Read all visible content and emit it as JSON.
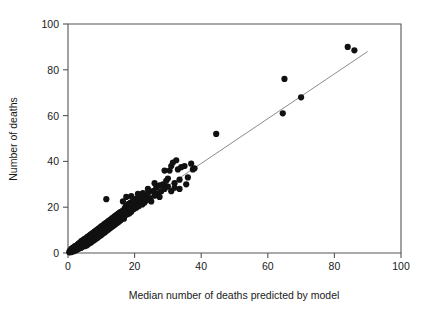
{
  "chart_data": {
    "type": "scatter",
    "title": "",
    "xlabel": "Median number of deaths predicted by model",
    "ylabel": "Number of deaths",
    "xlim": [
      0,
      100
    ],
    "ylim": [
      0,
      100
    ],
    "xticks": [
      0,
      20,
      40,
      60,
      80,
      100
    ],
    "yticks": [
      0,
      20,
      40,
      60,
      80,
      100
    ],
    "xticklabels": [
      "0",
      "20",
      "40",
      "60",
      "80",
      "100"
    ],
    "yticklabels": [
      "0",
      "20",
      "40",
      "60",
      "80",
      "100"
    ],
    "grid": false,
    "legend": null,
    "marker_color": "#111111",
    "marker_size": 4.0,
    "reference_line": {
      "name": "identity-fit-line",
      "color": "#8c8c8c",
      "x0": 0,
      "y0": 0,
      "x1": 90,
      "y1": 88
    },
    "points": [
      [
        0.4,
        0.3
      ],
      [
        0.5,
        0.8
      ],
      [
        0.6,
        0.4
      ],
      [
        0.7,
        1.1
      ],
      [
        0.8,
        0.5
      ],
      [
        0.9,
        1.4
      ],
      [
        1.0,
        0.7
      ],
      [
        1.0,
        1.8
      ],
      [
        1.1,
        0.4
      ],
      [
        1.2,
        1.2
      ],
      [
        1.3,
        2.0
      ],
      [
        1.4,
        0.9
      ],
      [
        1.5,
        1.6
      ],
      [
        1.5,
        2.4
      ],
      [
        1.6,
        1.1
      ],
      [
        1.7,
        2.1
      ],
      [
        1.8,
        0.8
      ],
      [
        1.9,
        1.7
      ],
      [
        2.0,
        2.6
      ],
      [
        2.0,
        1.3
      ],
      [
        2.1,
        3.0
      ],
      [
        2.2,
        1.9
      ],
      [
        2.3,
        2.5
      ],
      [
        2.4,
        1.2
      ],
      [
        2.5,
        3.2
      ],
      [
        2.6,
        2.1
      ],
      [
        2.7,
        1.5
      ],
      [
        2.8,
        3.5
      ],
      [
        2.9,
        2.4
      ],
      [
        3.0,
        1.8
      ],
      [
        3.0,
        3.8
      ],
      [
        3.1,
        2.7
      ],
      [
        3.2,
        4.1
      ],
      [
        3.3,
        2.0
      ],
      [
        3.4,
        3.3
      ],
      [
        3.5,
        4.4
      ],
      [
        3.6,
        2.6
      ],
      [
        3.7,
        3.9
      ],
      [
        3.8,
        2.2
      ],
      [
        3.9,
        4.8
      ],
      [
        4.0,
        3.1
      ],
      [
        4.0,
        5.2
      ],
      [
        4.1,
        2.5
      ],
      [
        4.2,
        4.3
      ],
      [
        4.3,
        3.6
      ],
      [
        4.4,
        5.5
      ],
      [
        4.5,
        2.9
      ],
      [
        4.6,
        4.6
      ],
      [
        4.7,
        3.4
      ],
      [
        4.8,
        5.9
      ],
      [
        4.9,
        4.0
      ],
      [
        5.0,
        3.0
      ],
      [
        5.0,
        6.2
      ],
      [
        5.1,
        4.8
      ],
      [
        5.2,
        3.7
      ],
      [
        5.3,
        5.6
      ],
      [
        5.4,
        4.2
      ],
      [
        5.5,
        6.5
      ],
      [
        5.6,
        3.3
      ],
      [
        5.7,
        5.1
      ],
      [
        5.8,
        6.9
      ],
      [
        5.9,
        4.5
      ],
      [
        6.0,
        3.8
      ],
      [
        6.0,
        7.2
      ],
      [
        6.1,
        5.4
      ],
      [
        6.2,
        4.1
      ],
      [
        6.3,
        6.3
      ],
      [
        6.4,
        7.6
      ],
      [
        6.5,
        5.0
      ],
      [
        6.6,
        4.4
      ],
      [
        6.7,
        6.8
      ],
      [
        6.8,
        8.0
      ],
      [
        6.9,
        5.7
      ],
      [
        7.0,
        4.7
      ],
      [
        7.0,
        7.3
      ],
      [
        7.1,
        8.4
      ],
      [
        7.2,
        6.1
      ],
      [
        7.3,
        5.2
      ],
      [
        7.4,
        7.8
      ],
      [
        7.5,
        8.8
      ],
      [
        7.6,
        6.5
      ],
      [
        7.7,
        5.5
      ],
      [
        7.8,
        8.2
      ],
      [
        7.9,
        9.2
      ],
      [
        8.0,
        6.9
      ],
      [
        8.0,
        5.8
      ],
      [
        8.1,
        8.6
      ],
      [
        8.2,
        9.6
      ],
      [
        8.3,
        7.3
      ],
      [
        8.4,
        6.2
      ],
      [
        8.5,
        9.0
      ],
      [
        8.6,
        10.0
      ],
      [
        8.7,
        7.7
      ],
      [
        8.8,
        6.6
      ],
      [
        8.9,
        9.4
      ],
      [
        9.0,
        10.4
      ],
      [
        9.0,
        8.1
      ],
      [
        9.1,
        7.0
      ],
      [
        9.2,
        9.8
      ],
      [
        9.3,
        10.8
      ],
      [
        9.4,
        8.5
      ],
      [
        9.5,
        7.4
      ],
      [
        9.6,
        10.2
      ],
      [
        9.7,
        11.2
      ],
      [
        9.8,
        8.9
      ],
      [
        9.9,
        7.8
      ],
      [
        10.0,
        10.6
      ],
      [
        10.0,
        11.6
      ],
      [
        10.1,
        9.3
      ],
      [
        10.2,
        8.2
      ],
      [
        10.3,
        11.0
      ],
      [
        10.4,
        12.0
      ],
      [
        10.5,
        9.7
      ],
      [
        10.6,
        8.6
      ],
      [
        10.7,
        11.4
      ],
      [
        10.8,
        12.4
      ],
      [
        10.9,
        10.1
      ],
      [
        11.0,
        9.0
      ],
      [
        11.0,
        11.8
      ],
      [
        11.1,
        12.8
      ],
      [
        11.2,
        10.5
      ],
      [
        11.3,
        9.4
      ],
      [
        11.4,
        12.2
      ],
      [
        11.5,
        13.2
      ],
      [
        11.6,
        10.9
      ],
      [
        11.7,
        9.8
      ],
      [
        11.8,
        12.6
      ],
      [
        11.9,
        13.6
      ],
      [
        12.0,
        11.3
      ],
      [
        12.0,
        10.2
      ],
      [
        12.1,
        13.0
      ],
      [
        12.2,
        14.0
      ],
      [
        12.3,
        11.7
      ],
      [
        12.4,
        10.6
      ],
      [
        12.5,
        13.4
      ],
      [
        12.6,
        14.4
      ],
      [
        12.7,
        12.1
      ],
      [
        12.8,
        11.0
      ],
      [
        12.9,
        13.8
      ],
      [
        13.0,
        14.8
      ],
      [
        13.0,
        12.5
      ],
      [
        13.1,
        11.4
      ],
      [
        13.2,
        14.2
      ],
      [
        13.3,
        15.2
      ],
      [
        13.4,
        12.9
      ],
      [
        13.5,
        11.8
      ],
      [
        13.6,
        14.6
      ],
      [
        13.7,
        15.6
      ],
      [
        13.8,
        13.3
      ],
      [
        13.9,
        12.2
      ],
      [
        14.0,
        15.0
      ],
      [
        14.0,
        16.0
      ],
      [
        14.1,
        13.7
      ],
      [
        14.2,
        12.6
      ],
      [
        14.3,
        15.4
      ],
      [
        14.4,
        16.4
      ],
      [
        14.5,
        14.1
      ],
      [
        14.6,
        13.0
      ],
      [
        14.7,
        15.8
      ],
      [
        14.8,
        16.8
      ],
      [
        14.9,
        14.5
      ],
      [
        15.0,
        13.4
      ],
      [
        15.0,
        16.2
      ],
      [
        15.1,
        17.2
      ],
      [
        15.2,
        14.9
      ],
      [
        15.3,
        13.8
      ],
      [
        15.4,
        16.6
      ],
      [
        15.5,
        17.6
      ],
      [
        15.6,
        15.3
      ],
      [
        15.7,
        14.2
      ],
      [
        15.8,
        17.0
      ],
      [
        15.9,
        18.0
      ],
      [
        16.0,
        15.7
      ],
      [
        16.0,
        14.6
      ],
      [
        16.2,
        17.4
      ],
      [
        16.4,
        18.4
      ],
      [
        16.6,
        16.1
      ],
      [
        16.8,
        15.0
      ],
      [
        17.0,
        17.8
      ],
      [
        17.0,
        19.5
      ],
      [
        17.2,
        16.5
      ],
      [
        17.4,
        20.5
      ],
      [
        17.6,
        18.2
      ],
      [
        17.8,
        16.9
      ],
      [
        18.0,
        19.0
      ],
      [
        18.2,
        21.5
      ],
      [
        18.4,
        17.3
      ],
      [
        18.6,
        19.8
      ],
      [
        18.8,
        22.0
      ],
      [
        19.0,
        18.0
      ],
      [
        19.2,
        20.6
      ],
      [
        19.5,
        22.6
      ],
      [
        19.8,
        19.2
      ],
      [
        20.0,
        21.0
      ],
      [
        20.2,
        23.5
      ],
      [
        20.5,
        19.8
      ],
      [
        20.8,
        22.2
      ],
      [
        21.0,
        24.0
      ],
      [
        21.3,
        20.5
      ],
      [
        21.6,
        23.0
      ],
      [
        22.0,
        25.0
      ],
      [
        22.3,
        21.2
      ],
      [
        22.6,
        24.2
      ],
      [
        23.0,
        22.0
      ],
      [
        23.4,
        25.5
      ],
      [
        23.8,
        23.2
      ],
      [
        24.2,
        26.5
      ],
      [
        24.6,
        24.0
      ],
      [
        25.0,
        22.5
      ],
      [
        25.5,
        27.0
      ],
      [
        26.0,
        25.0
      ],
      [
        26.5,
        28.5
      ],
      [
        27.0,
        26.0
      ],
      [
        27.5,
        29.5
      ],
      [
        28.0,
        27.0
      ],
      [
        28.5,
        30.0
      ],
      [
        29.0,
        28.0
      ],
      [
        29.5,
        31.5
      ],
      [
        30.0,
        29.0
      ],
      [
        30.5,
        36.0
      ],
      [
        31.0,
        38.0
      ],
      [
        31.5,
        39.5
      ],
      [
        32.0,
        30.5
      ],
      [
        32.5,
        40.5
      ],
      [
        33.0,
        36.5
      ],
      [
        33.5,
        32.0
      ],
      [
        34.0,
        37.5
      ],
      [
        35.0,
        38.0
      ],
      [
        36.0,
        33.0
      ],
      [
        37.0,
        39.0
      ],
      [
        37.5,
        36.5
      ],
      [
        38.0,
        37.0
      ],
      [
        11.5,
        23.5
      ],
      [
        16.5,
        22.5
      ],
      [
        17.5,
        24.5
      ],
      [
        19.0,
        24.8
      ],
      [
        21.0,
        25.8
      ],
      [
        22.5,
        26.2
      ],
      [
        24.0,
        28.0
      ],
      [
        26.0,
        30.5
      ],
      [
        27.5,
        24.5
      ],
      [
        29.0,
        36.0
      ],
      [
        30.0,
        32.5
      ],
      [
        31.0,
        27.0
      ],
      [
        32.0,
        28.5
      ],
      [
        33.5,
        28.0
      ],
      [
        35.5,
        30.0
      ],
      [
        44.5,
        52.0
      ],
      [
        64.5,
        61.0
      ],
      [
        65.0,
        76.0
      ],
      [
        70.0,
        68.0
      ],
      [
        84.0,
        90.0
      ],
      [
        86.0,
        88.5
      ]
    ]
  }
}
